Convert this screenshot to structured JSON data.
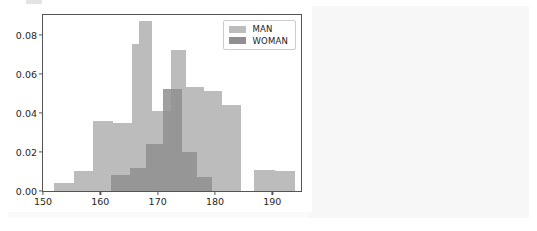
{
  "figure": {
    "background_color": "#ffffff",
    "panel_color": "#fafafa",
    "frame_color": "#555555"
  },
  "chart_data": {
    "type": "bar",
    "subtype": "histogram",
    "title": "",
    "xlabel": "",
    "ylabel": "",
    "xlim": [
      150,
      195
    ],
    "ylim": [
      0.0,
      0.09
    ],
    "xticks": [
      150,
      160,
      170,
      180,
      190
    ],
    "yticks": [
      0.0,
      0.02,
      0.04,
      0.06,
      0.08
    ],
    "xtick_labels": [
      "150",
      "160",
      "170",
      "180",
      "190"
    ],
    "ytick_labels": [
      "0.00",
      "0.02",
      "0.04",
      "0.06",
      "0.08"
    ],
    "grid": false,
    "legend_position": "upper right",
    "bin_edges": [
      152.0,
      155.4,
      158.8,
      162.2,
      165.6,
      169.0,
      172.4,
      175.8,
      179.2,
      182.6,
      186.0,
      189.4,
      192.8
    ],
    "series": [
      {
        "name": "MAN",
        "color": "#bcbcbc",
        "values": [
          0.004,
          0.01,
          0.036,
          0.035,
          0.075,
          0.087,
          0.041,
          0.072,
          0.053,
          0.051,
          0.044,
          0.011,
          0.01
        ],
        "bin_starts": [
          152.0,
          155.4,
          158.8,
          162.2,
          165.6,
          166.8,
          169.0,
          172.4,
          175.0,
          178.0,
          181.2,
          186.8,
          190.4
        ],
        "bin_widths": [
          3.4,
          3.4,
          3.4,
          3.4,
          1.2,
          2.2,
          3.4,
          2.6,
          3.0,
          3.2,
          3.4,
          3.6,
          3.6
        ]
      },
      {
        "name": "WOMAN",
        "color": "#8f8f8f",
        "values": [
          0.008,
          0.012,
          0.024,
          0.052,
          0.02,
          0.007
        ],
        "bin_starts": [
          161.8,
          165.2,
          168.0,
          171.0,
          174.2,
          176.8
        ],
        "bin_widths": [
          3.4,
          2.8,
          3.0,
          3.2,
          2.6,
          2.6
        ]
      }
    ],
    "legend": [
      {
        "label": "MAN",
        "color": "#bcbcbc"
      },
      {
        "label": "WOMAN",
        "color": "#8f8f8f"
      }
    ]
  }
}
